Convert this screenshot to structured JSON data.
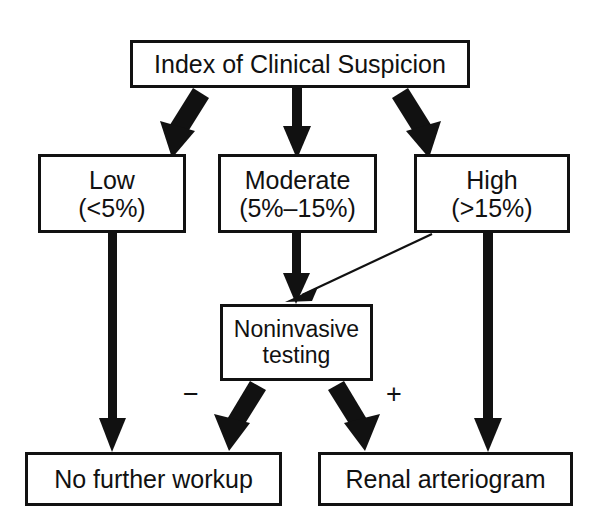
{
  "diagram": {
    "background_color": "#ffffff",
    "stroke_color": "#111111",
    "nodes": {
      "root": {
        "line1": "Index of Clinical Suspicion"
      },
      "low": {
        "line1": "Low",
        "line2": "(<5%)"
      },
      "moderate": {
        "line1": "Moderate",
        "line2": "(5%–15%)"
      },
      "high": {
        "line1": "High",
        "line2": "(>15%)"
      },
      "noninvasive": {
        "line1": "Noninvasive",
        "line2": "testing"
      },
      "no_further_workup": {
        "line1": "No further workup"
      },
      "renal_arteriogram": {
        "line1": "Renal arteriogram"
      }
    },
    "edge_labels": {
      "negative": "−",
      "positive": "+"
    }
  }
}
